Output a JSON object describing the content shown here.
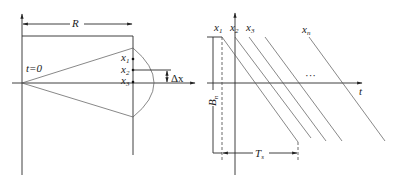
{
  "left_diagram": {
    "dimension_label": "R",
    "origin_label": "t=0",
    "points": [
      {
        "label": "x",
        "sub": "1"
      },
      {
        "label": "x",
        "sub": "2"
      },
      {
        "label": "x",
        "sub": "3"
      }
    ],
    "delta_label": "Δx"
  },
  "right_diagram": {
    "axis_label": "t",
    "lines": [
      {
        "label": "x",
        "sub": "1"
      },
      {
        "label": "x",
        "sub": "2"
      },
      {
        "label": "x",
        "sub": "3"
      },
      {
        "label": "x",
        "sub": "n"
      }
    ],
    "ellipsis": "···",
    "height_label": "B",
    "height_sub": "n",
    "width_label": "T",
    "width_sub": "s"
  },
  "colors": {
    "line": "#2a2a2a",
    "background": "#ffffff"
  }
}
